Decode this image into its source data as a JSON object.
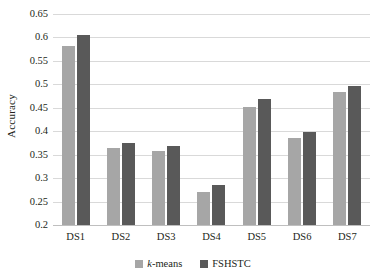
{
  "chart_data": {
    "type": "bar",
    "title": "",
    "xlabel": "",
    "ylabel": "Accuracy",
    "categories": [
      "DS1",
      "DS2",
      "DS3",
      "DS4",
      "DS5",
      "DS6",
      "DS7"
    ],
    "series": [
      {
        "name": "k-means",
        "color": "#a6a6a6",
        "values": [
          0.581,
          0.364,
          0.357,
          0.271,
          0.452,
          0.385,
          0.483
        ]
      },
      {
        "name": "FSHSTC",
        "color": "#595959",
        "values": [
          0.606,
          0.375,
          0.368,
          0.286,
          0.468,
          0.399,
          0.497
        ]
      }
    ],
    "ylim": [
      0.2,
      0.65
    ],
    "ytick_values": [
      0.2,
      0.25,
      0.3,
      0.35,
      0.4,
      0.45,
      0.5,
      0.55,
      0.6,
      0.65
    ],
    "ytick_labels": [
      "0.2",
      "0.25",
      "0.3",
      "0.35",
      "0.4",
      "0.45",
      "0.5",
      "0.55",
      "0.6",
      "0.65"
    ],
    "grid": "horizontal",
    "legend_position": "bottom"
  },
  "legend": {
    "items": [
      {
        "label_prefix": "k",
        "label_suffix": "-means"
      },
      {
        "label_prefix": "",
        "label_suffix": "FSHSTC"
      }
    ]
  }
}
